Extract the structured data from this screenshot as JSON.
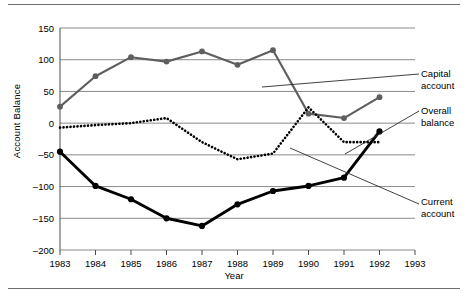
{
  "chart_data": {
    "type": "line",
    "title": "",
    "xlabel": "Year",
    "ylabel": "Account Balance",
    "x": [
      1983,
      1984,
      1985,
      1986,
      1987,
      1988,
      1989,
      1990,
      1991,
      1992,
      1993
    ],
    "xtick_labels": [
      "1983",
      "1984",
      "1985",
      "1986",
      "1987",
      "1988",
      "1989",
      "1990",
      "1991",
      "1992",
      "1993"
    ],
    "xlim": [
      1983,
      1993
    ],
    "ylim": [
      -200,
      150
    ],
    "ytick_labels": [
      "150",
      "100",
      "50",
      "0",
      "-50",
      "-100",
      "-150",
      "-200"
    ],
    "yticks": [
      150,
      100,
      50,
      0,
      -50,
      -100,
      -150,
      -200
    ],
    "grid": true,
    "legend_position": "right-annotations",
    "series": [
      {
        "name": "Capital account",
        "color": "#5e5e5e",
        "style": "solid",
        "marker": "circle",
        "x": [
          1983,
          1984,
          1985,
          1986,
          1987,
          1988,
          1989,
          1990,
          1991,
          1992
        ],
        "values": [
          26,
          74,
          104,
          97,
          113,
          92,
          115,
          15,
          8,
          41
        ]
      },
      {
        "name": "Overall balance",
        "color": "#000000",
        "style": "dotted",
        "marker": "none",
        "x": [
          1983,
          1984,
          1985,
          1986,
          1987,
          1988,
          1989,
          1990,
          1991,
          1992
        ],
        "values": [
          -7,
          -3,
          0,
          8,
          -30,
          -57,
          -48,
          25,
          -30,
          -30
        ]
      },
      {
        "name": "Current account",
        "color": "#000000",
        "style": "solid",
        "marker": "circle",
        "x": [
          1983,
          1984,
          1985,
          1986,
          1987,
          1988,
          1989,
          1990,
          1991,
          1992
        ],
        "values": [
          -45,
          -99,
          -120,
          -150,
          -162,
          -128,
          -107,
          -99,
          -86,
          -13
        ]
      }
    ],
    "annotations": [
      {
        "id": "capital",
        "line1": "Capital",
        "line2": "account"
      },
      {
        "id": "overall",
        "line1": "Overall",
        "line2": "balance"
      },
      {
        "id": "current",
        "line1": "Current",
        "line2": "account"
      }
    ]
  }
}
